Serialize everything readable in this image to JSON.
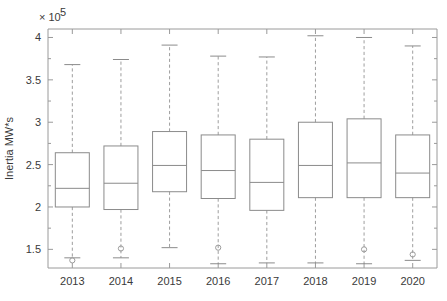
{
  "figure": {
    "background_color": "#ffffff",
    "line_color": "#8b8b8b",
    "text_color": "#3a3a3a",
    "exponent_label": "× 10",
    "exponent_power": "5",
    "ylabel": "Inertia MW*s"
  },
  "chart_data": {
    "type": "box",
    "title": "",
    "xlabel": "",
    "ylabel": "Inertia MW*s",
    "y_scale_multiplier": 100000,
    "y_scale_label": "× 10^5",
    "ylim": [
      1.28,
      4.1
    ],
    "grid": false,
    "legend": null,
    "categories": [
      "2013",
      "2014",
      "2015",
      "2016",
      "2017",
      "2018",
      "2019",
      "2020"
    ],
    "y_ticks": [
      1.5,
      2,
      2.5,
      3,
      3.5,
      4
    ],
    "y_tick_labels": [
      "1.5",
      "2",
      "2.5",
      "3",
      "3.5",
      "4"
    ],
    "y_minor_tick_step": 0.25,
    "boxes": [
      {
        "category": "2013",
        "whisker_high": 3.68,
        "q3": 2.64,
        "median": 2.22,
        "q1": 2.0,
        "whisker_low": 1.4,
        "outliers": [
          1.37
        ]
      },
      {
        "category": "2014",
        "whisker_high": 3.74,
        "q3": 2.72,
        "median": 2.28,
        "q1": 1.97,
        "whisker_low": 1.4,
        "outliers": [
          1.51
        ]
      },
      {
        "category": "2015",
        "whisker_high": 3.91,
        "q3": 2.89,
        "median": 2.49,
        "q1": 2.18,
        "whisker_low": 1.52,
        "outliers": []
      },
      {
        "category": "2016",
        "whisker_high": 3.78,
        "q3": 2.85,
        "median": 2.43,
        "q1": 2.1,
        "whisker_low": 1.33,
        "outliers": [
          1.52
        ]
      },
      {
        "category": "2017",
        "whisker_high": 3.77,
        "q3": 2.8,
        "median": 2.29,
        "q1": 1.96,
        "whisker_low": 1.34,
        "outliers": []
      },
      {
        "category": "2018",
        "whisker_high": 4.02,
        "q3": 3.0,
        "median": 2.49,
        "q1": 2.11,
        "whisker_low": 1.34,
        "outliers": []
      },
      {
        "category": "2019",
        "whisker_high": 4.0,
        "q3": 3.04,
        "median": 2.52,
        "q1": 2.11,
        "whisker_low": 1.33,
        "outliers": [
          1.5
        ]
      },
      {
        "category": "2020",
        "whisker_high": 3.9,
        "q3": 2.85,
        "median": 2.4,
        "q1": 2.11,
        "whisker_low": 1.37,
        "outliers": [
          1.44
        ]
      }
    ]
  }
}
